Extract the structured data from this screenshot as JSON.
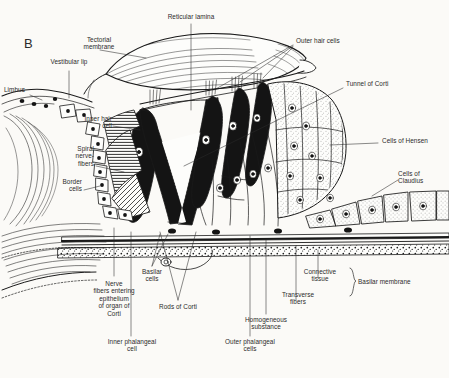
{
  "figure": {
    "panel_letter": "B",
    "subject": "Organ of Corti",
    "style": "black-and-white histological line drawing",
    "background_color": "#fbfaf7",
    "ink_color": "#1a1a1a"
  },
  "labels": {
    "reticular_lamina": "Reticular lamina",
    "tectorial_membrane": "Tectorial\nmembrane",
    "vestibular_lip": "Vestibular lip",
    "limbus": "Limbus",
    "outer_hair_cells": "Outer hair cells",
    "tunnel_of_corti": "Tunnel of Corti",
    "cells_of_hensen": "Cells of Hensen",
    "cells_of_claudius": "Cells of\nClaudius",
    "inner_hair_cell": "Inner hair\ncell",
    "spiral_nerve_fibers": "Spiral\nnerve-\nfibers",
    "border_cells": "Border\ncells",
    "nerve_fibers_entering": "Nerve\nfibers entering\nepithelium\nof organ of\nCorti",
    "basilar_cells": "Basilar\ncells",
    "rods_of_corti": "Rods of Corti",
    "inner_phalangeal_cell": "Inner phalangeal\ncell",
    "outer_phalangeal_cells": "Outer phalangeal\ncells",
    "homogeneous_substance": "Homogeneous\nsubstance",
    "transverse_fibers": "Transverse\nfibers",
    "connective_tissue": "Connective\ntissue",
    "basilar_membrane": "Basilar membrane"
  },
  "structures": [
    {
      "name": "tectorial-membrane",
      "description": "large striated lens-shaped flap overhanging the hair cells"
    },
    {
      "name": "reticular-lamina",
      "description": "thin plate at apical surface of hair cells"
    },
    {
      "name": "inner-hair-cell",
      "description": "single dark flask-shaped cell medial to the tunnel"
    },
    {
      "name": "outer-hair-cells",
      "description": "three dark elongated cells lateral to the tunnel"
    },
    {
      "name": "tunnel-of-corti",
      "description": "triangular A-shaped space between inner and outer rods"
    },
    {
      "name": "rods-of-corti",
      "description": "two heavy dark pillars forming the tunnel"
    },
    {
      "name": "cells-of-hensen",
      "description": "tall stippled columnar cells sloping down to the right"
    },
    {
      "name": "cells-of-claudius",
      "description": "low cuboidal stippled cells at the lateral base"
    },
    {
      "name": "border-cells",
      "description": "chain of small rectangular cells along the inner curve"
    },
    {
      "name": "spiral-nerve-fibers",
      "description": "hatched band entering under the inner hair cell"
    },
    {
      "name": "basilar-membrane",
      "description": "horizontal layered band at the base with homogeneous substance, transverse fibers and connective tissue"
    },
    {
      "name": "limbus",
      "description": "fibrous shelf at far left"
    }
  ]
}
